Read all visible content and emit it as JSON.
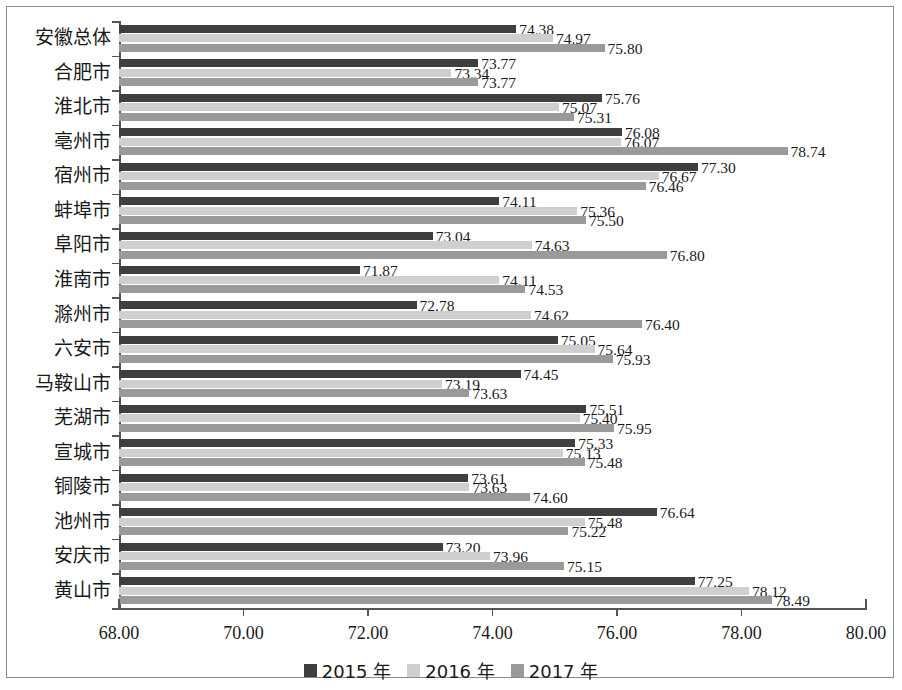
{
  "chart_data": {
    "type": "bar",
    "orientation": "horizontal",
    "title": "",
    "xlabel": "",
    "ylabel": "",
    "xlim": [
      68.0,
      80.0
    ],
    "xticks": [
      "68.00",
      "70.00",
      "72.00",
      "74.00",
      "76.00",
      "78.00",
      "80.00"
    ],
    "grid": false,
    "legend_position": "bottom",
    "categories": [
      "安徽总体",
      "合肥市",
      "淮北市",
      "亳州市",
      "宿州市",
      "蚌埠市",
      "阜阳市",
      "淮南市",
      "滁州市",
      "六安市",
      "马鞍山市",
      "芜湖市",
      "宣城市",
      "铜陵市",
      "池州市",
      "安庆市",
      "黄山市"
    ],
    "series": [
      {
        "name": "2015 年",
        "color": "#3f3f3f",
        "values": [
          74.38,
          73.77,
          75.76,
          76.08,
          77.3,
          74.11,
          73.04,
          71.87,
          72.78,
          75.05,
          74.45,
          75.51,
          75.33,
          73.61,
          76.64,
          73.2,
          77.25
        ],
        "labels": [
          "74.38",
          "73.77",
          "75.76",
          "76.08",
          "77.30",
          "74.11",
          "73.04",
          "71.87",
          "72.78",
          "75.05",
          "74.45",
          "75.51",
          "75.33",
          "73.61",
          "76.64",
          "73.20",
          "77.25"
        ]
      },
      {
        "name": "2016 年",
        "color": "#cfcfcf",
        "values": [
          74.97,
          73.34,
          75.07,
          76.07,
          76.67,
          75.36,
          74.63,
          74.11,
          74.62,
          75.64,
          73.19,
          75.4,
          75.13,
          73.63,
          75.48,
          73.96,
          78.12
        ],
        "labels": [
          "74.97",
          "73.34",
          "75.07",
          "76.07",
          "76.67",
          "75.36",
          "74.63",
          "74.11",
          "74.62",
          "75.64",
          "73.19",
          "75.40",
          "75.13",
          "73.63",
          "75.48",
          "73.96",
          "78.12"
        ]
      },
      {
        "name": "2017 年",
        "color": "#9a9a9a",
        "values": [
          75.8,
          73.77,
          75.31,
          78.74,
          76.46,
          75.5,
          76.8,
          74.53,
          76.4,
          75.93,
          73.63,
          75.95,
          75.48,
          74.6,
          75.22,
          75.15,
          78.49
        ],
        "labels": [
          "75.80",
          "73.77",
          "75.31",
          "78.74",
          "76.46",
          "75.50",
          "76.80",
          "74.53",
          "76.40",
          "75.93",
          "73.63",
          "75.95",
          "75.48",
          "74.60",
          "75.22",
          "75.15",
          "78.49"
        ]
      }
    ]
  },
  "legend": {
    "items": [
      {
        "label": "2015 年",
        "color": "#3f3f3f"
      },
      {
        "label": "2016 年",
        "color": "#cfcfcf"
      },
      {
        "label": "2017 年",
        "color": "#9a9a9a"
      }
    ]
  }
}
